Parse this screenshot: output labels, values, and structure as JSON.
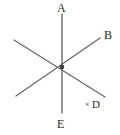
{
  "figure": {
    "width": 120,
    "height": 135,
    "background_color": "#ffffff",
    "stroke_color": "#6b6b6b",
    "label_color": "#2b2b2b",
    "stroke_width": 1.4,
    "center_point": {
      "x": 62,
      "y": 67,
      "radius": 2.2,
      "color": "#3a3a3a"
    },
    "lines": [
      {
        "name": "line-vertical-AE",
        "from_label": "A",
        "to_label": "E",
        "x1": 62,
        "y1": 14,
        "x2": 62,
        "y2": 113
      },
      {
        "name": "line-diagonal-B",
        "from_label": "B",
        "to_label": "",
        "x1": 100,
        "y1": 38,
        "x2": 16,
        "y2": 96
      },
      {
        "name": "line-diagonal-lower-right",
        "from_label": "",
        "to_label": "",
        "x1": 14,
        "y1": 40,
        "x2": 105,
        "y2": 97
      }
    ],
    "vertex_labels": [
      {
        "id": "A",
        "text": "A",
        "x": 57,
        "y": 2
      },
      {
        "id": "B",
        "text": "B",
        "x": 104,
        "y": 29
      },
      {
        "id": "E",
        "text": "E",
        "x": 57,
        "y": 118
      }
    ],
    "marked_points": [
      {
        "id": "D",
        "mark": "×",
        "text": "D",
        "mark_x": 85,
        "mark_y": 101,
        "label_x": 92,
        "label_y": 99
      }
    ]
  }
}
